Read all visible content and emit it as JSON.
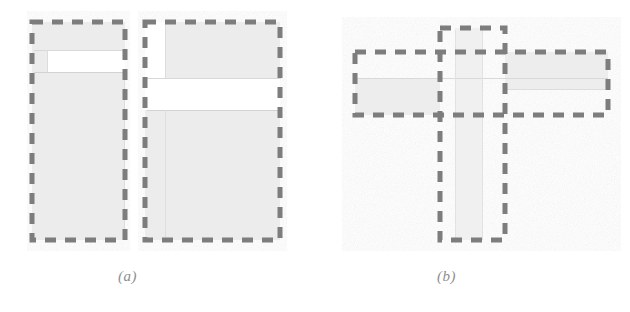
{
  "figure": {
    "title": "",
    "background_color": "#ffffff",
    "width": 630,
    "height": 312,
    "style": {
      "fill_color": "#ececec",
      "fill_color_light": "#f1f1f1",
      "dash_color": "#7d7d7d",
      "dash_color_soft": "#9a9a9a",
      "thin_line_color": "#d6d6d6",
      "caption_color": "#8e8e8e",
      "stroke_width": 5,
      "dash_pattern": "11 9"
    },
    "panels": [
      {
        "id": "a",
        "caption": "(a)",
        "caption_x": 118,
        "caption_y": 268,
        "description": "two adjacent dashed rectangles with notched gray fill regions",
        "shapes": [
          {
            "name": "left-dashed-rectangle",
            "kind": "dashed-rect",
            "x": 32,
            "y": 22,
            "width": 93,
            "height": 218
          },
          {
            "name": "left-filled-region",
            "kind": "filled-polygon",
            "points": "32,22 125,22 125,50 47,50 47,72 125,72 125,240 32,240"
          },
          {
            "name": "right-dashed-rectangle",
            "kind": "dashed-rect",
            "x": 145,
            "y": 22,
            "width": 135,
            "height": 218
          },
          {
            "name": "right-filled-region",
            "kind": "filled-polygon",
            "points": "165,22 280,22 280,78 280,78 280,110 145,110 145,240 280,240 280,110 145,110 145,78 165,78"
          }
        ]
      },
      {
        "id": "b",
        "caption": "(b)",
        "caption_x": 437,
        "caption_y": 268,
        "description": "vertical dashed rectangle crossed by a horizontal dashed rectangle forming a cross",
        "shapes": [
          {
            "name": "vertical-dashed-rectangle",
            "kind": "dashed-rect",
            "x": 440,
            "y": 28,
            "width": 65,
            "height": 212
          },
          {
            "name": "horizontal-dashed-rectangle",
            "kind": "dashed-rect",
            "x": 355,
            "y": 52,
            "width": 253,
            "height": 63
          },
          {
            "name": "vertical-filled-band",
            "kind": "filled-rect",
            "x": 455,
            "y": 28,
            "width": 28,
            "height": 212
          },
          {
            "name": "horizontal-filled-band-left",
            "kind": "filled-rect",
            "x": 355,
            "y": 78,
            "width": 85,
            "height": 37
          },
          {
            "name": "horizontal-filled-band-right",
            "kind": "filled-rect",
            "x": 505,
            "y": 52,
            "width": 103,
            "height": 37
          }
        ]
      }
    ]
  }
}
